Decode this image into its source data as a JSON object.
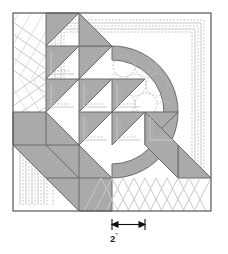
{
  "figure": {
    "kind": "quilt-block-diagram",
    "block": {
      "x": 13,
      "y": 13,
      "size": 198,
      "grid_cells": 6,
      "cell_size": 33,
      "outline_color": "#555555",
      "background_color": "#ffffff"
    },
    "colors": {
      "fabric_gray": "#aaaaaa",
      "fabric_white": "#ffffff",
      "piecing_line": "#6b6b6b",
      "quilting_line": "#c9c9c9",
      "quilting_line_dotted": "#bdbdbd",
      "arrow_color": "#111111",
      "text_color": "#1a1a1a"
    },
    "dimension": {
      "value": "2",
      "unit": "\"",
      "span_inches": 2,
      "arrow_left_x": 112,
      "arrow_right_x": 145,
      "arrow_y": 224
    },
    "regions": [
      {
        "name": "top-left-border-strip",
        "fill": "white",
        "quilting": "diagonal-chevron-lines"
      },
      {
        "name": "bottom-border-strip",
        "fill": "white",
        "quilting": "zigzag-chevron-lines"
      },
      {
        "name": "center-diagonal-triangle-chain",
        "fill": "gray",
        "quilting": "outline-squares"
      },
      {
        "name": "quarter-arc-band",
        "fill": "gray",
        "quilting": "arc-outline"
      },
      {
        "name": "arc-inner-field",
        "fill": "white",
        "quilting": "clamshell-scallops"
      },
      {
        "name": "lower-left-diagonal-band",
        "fill": "gray",
        "quilting": "triangle-divisions"
      },
      {
        "name": "lower-left-field",
        "fill": "white",
        "quilting": "concentric-squares"
      }
    ],
    "half_square_triangles": [
      {
        "row": 1,
        "col": 2,
        "orientation": "upper-left"
      },
      {
        "row": 2,
        "col": 2,
        "orientation": "upper-left"
      },
      {
        "row": 3,
        "col": 2,
        "orientation": "upper-left"
      },
      {
        "row": 2,
        "col": 3,
        "orientation": "upper-left"
      },
      {
        "row": 3,
        "col": 3,
        "orientation": "upper-left"
      },
      {
        "row": 4,
        "col": 3,
        "orientation": "upper-left"
      },
      {
        "row": 3,
        "col": 4,
        "orientation": "upper-left"
      },
      {
        "row": 4,
        "col": 4,
        "orientation": "upper-left"
      },
      {
        "row": 4,
        "col": 5,
        "orientation": "upper-left"
      }
    ]
  }
}
